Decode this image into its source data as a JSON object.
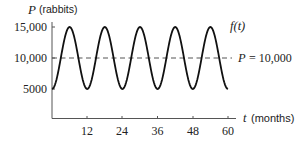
{
  "chart_data": {
    "type": "line",
    "title": "",
    "xlabel": "t (months)",
    "ylabel": "P (rabbits)",
    "x_var": "t",
    "x_unit": "(months)",
    "y_var": "P",
    "y_unit": "(rabbits)",
    "xlim": [
      0,
      60
    ],
    "ylim": [
      0,
      16000
    ],
    "x_ticks": [
      12,
      24,
      36,
      48,
      60
    ],
    "x_tick_labels": [
      "12",
      "24",
      "36",
      "48",
      "60"
    ],
    "y_ticks": [
      5000,
      10000,
      15000
    ],
    "y_tick_labels": [
      "5000",
      "10,000",
      "15,000"
    ],
    "grid": false,
    "legend": null,
    "series": [
      {
        "name": "f(t)",
        "style": "solid",
        "formula_hint": "P = 10000 - 5000*cos(pi*t/6)",
        "x": [
          0,
          3,
          6,
          9,
          12,
          15,
          18,
          21,
          24,
          27,
          30,
          33,
          36,
          39,
          42,
          45,
          48,
          51,
          54,
          57,
          60
        ],
        "values": [
          5000,
          10000,
          15000,
          10000,
          5000,
          10000,
          15000,
          10000,
          5000,
          10000,
          15000,
          10000,
          5000,
          10000,
          15000,
          10000,
          5000,
          10000,
          15000,
          10000,
          5000
        ]
      },
      {
        "name": "P = 10,000",
        "style": "dashed",
        "x": [
          0,
          60
        ],
        "values": [
          10000,
          10000
        ]
      }
    ],
    "annotations": [
      {
        "text": "f(t)",
        "near": "last peak, right side"
      },
      {
        "text": "P = 10,000",
        "near": "right end of dashed line"
      }
    ]
  },
  "labels": {
    "y_var": "P",
    "y_unit": "(rabbits)",
    "x_var": "t",
    "x_unit": "(months)",
    "curve_label": "f(t)",
    "line_label_var": "P",
    "line_label_eq": "= 10,000",
    "ytick_15000": "15,000",
    "ytick_10000": "10,000",
    "ytick_5000": "5000",
    "xtick_12": "12",
    "xtick_24": "24",
    "xtick_36": "36",
    "xtick_48": "48",
    "xtick_60": "60"
  }
}
